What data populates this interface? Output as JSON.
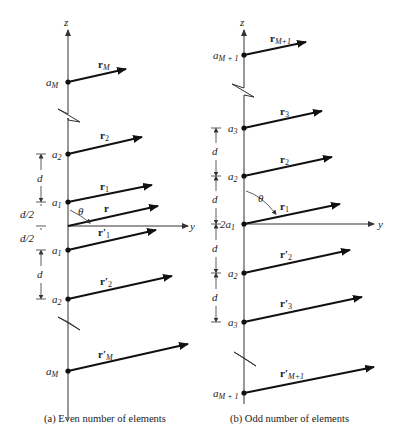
{
  "panels": [
    {
      "id": "a",
      "caption": "(a)  Even number of elements",
      "axis_z": "z",
      "axis_y": "y",
      "angle": "θ",
      "elements": [
        {
          "label": "a",
          "sub": "M",
          "vector": "r",
          "vsub": "M"
        },
        {
          "label": "a",
          "sub": "2",
          "vector": "r",
          "vsub": "2"
        },
        {
          "label": "a",
          "sub": "1",
          "vector": "r",
          "vsub": "1"
        },
        {
          "label": "",
          "sub": "",
          "vector": "r",
          "vsub": ""
        },
        {
          "label": "a",
          "sub": "1",
          "vector": "r′",
          "vsub": "1"
        },
        {
          "label": "a",
          "sub": "2",
          "vector": "r′",
          "vsub": "2"
        },
        {
          "label": "a",
          "sub": "M",
          "vector": "r′",
          "vsub": "M"
        }
      ],
      "spacings": [
        "d",
        "d/2",
        "d/2",
        "d"
      ]
    },
    {
      "id": "b",
      "caption": "(b)  Odd number of elements",
      "axis_z": "z",
      "axis_y": "y",
      "angle": "θ",
      "elements": [
        {
          "label": "a",
          "sub": "M + 1",
          "vector": "r",
          "vsub": "M+1"
        },
        {
          "label": "a",
          "sub": "3",
          "vector": "r",
          "vsub": "3"
        },
        {
          "label": "a",
          "sub": "2",
          "vector": "r",
          "vsub": "2"
        },
        {
          "label": "2a",
          "sub": "1",
          "vector": "r",
          "vsub": "1"
        },
        {
          "label": "a",
          "sub": "2",
          "vector": "r′",
          "vsub": "2"
        },
        {
          "label": "a",
          "sub": "3",
          "vector": "r′",
          "vsub": "3"
        },
        {
          "label": "a",
          "sub": "M + 1",
          "vector": "r′",
          "vsub": "M+1"
        }
      ],
      "spacings": [
        "d",
        "d",
        "d",
        "d"
      ]
    }
  ]
}
